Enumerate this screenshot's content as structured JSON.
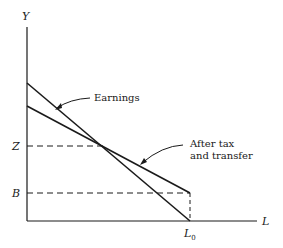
{
  "diagram": {
    "axes": {
      "y_label": "Y",
      "x_label": "L",
      "x_tick": "L",
      "x_tick_sub": "0"
    },
    "y_levels": {
      "Z": "Z",
      "B": "B"
    },
    "curves": [
      {
        "name": "Earnings",
        "label": "Earnings",
        "from": [
          0,
          "high"
        ],
        "to": [
          "L0",
          0
        ]
      },
      {
        "name": "After tax and transfer",
        "label_line1": "After tax",
        "label_line2": "and transfer",
        "from": [
          0,
          "mid"
        ],
        "to": [
          "L0",
          "B"
        ]
      }
    ],
    "colors": {
      "line": "#1a1a1a",
      "background": "#ffffff"
    }
  }
}
